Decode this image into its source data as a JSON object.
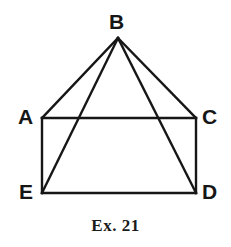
{
  "figure": {
    "caption": "Ex. 21",
    "stroke_color": "#161616",
    "background_color": "#ffffff",
    "stroke_width": 2,
    "vertices": [
      {
        "id": "B",
        "label": "B",
        "x": 118,
        "y": 38
      },
      {
        "id": "A",
        "label": "A",
        "x": 42,
        "y": 118
      },
      {
        "id": "C",
        "label": "C",
        "x": 196,
        "y": 118
      },
      {
        "id": "E",
        "label": "E",
        "x": 42,
        "y": 193
      },
      {
        "id": "D",
        "label": "D",
        "x": 196,
        "y": 193
      }
    ],
    "segments": [
      {
        "id": "AC",
        "from": "A",
        "to": "C"
      },
      {
        "id": "CD",
        "from": "C",
        "to": "D"
      },
      {
        "id": "DE",
        "from": "D",
        "to": "E"
      },
      {
        "id": "EA",
        "from": "E",
        "to": "A"
      },
      {
        "id": "BA",
        "from": "B",
        "to": "A"
      },
      {
        "id": "BC",
        "from": "B",
        "to": "C"
      },
      {
        "id": "BE",
        "from": "B",
        "to": "E"
      },
      {
        "id": "BD",
        "from": "B",
        "to": "D"
      }
    ]
  }
}
